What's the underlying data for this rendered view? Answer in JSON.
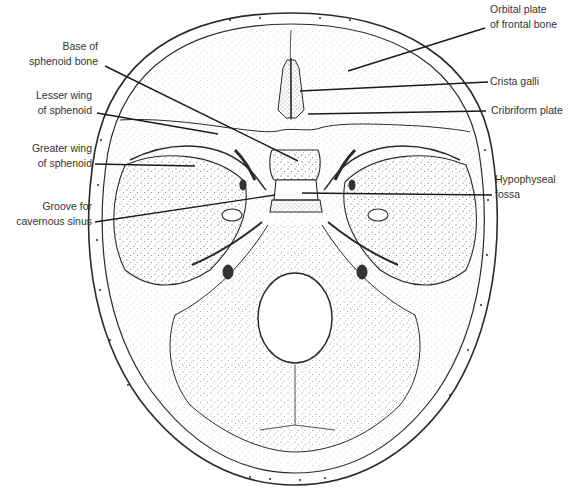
{
  "figure": {
    "colors": {
      "ink": "#2a2a2a",
      "paper": "#ffffff",
      "stipple": "#555555"
    }
  },
  "labels": {
    "base_sphenoid": {
      "line1": "Base of",
      "line2": "sphenoid bone"
    },
    "lesser_wing": {
      "line1": "Lesser wing",
      "line2": "of sphenoid"
    },
    "greater_wing": {
      "line1": "Greater wing",
      "line2": "of sphenoid"
    },
    "groove_cavernous": {
      "line1": "Groove for",
      "line2": "cavernous sinus"
    },
    "orbital_plate": {
      "line1": "Orbital plate",
      "line2": "of frontal bone"
    },
    "crista_galli": {
      "line1": "Crista galli"
    },
    "cribriform": {
      "line1": "Cribriform plate"
    },
    "hypophyseal": {
      "line1": "Hypophyseal",
      "line2": "fossa"
    }
  }
}
